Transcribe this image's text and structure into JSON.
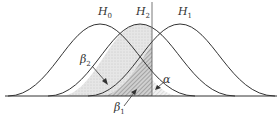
{
  "diagram": {
    "type": "overlapping normal distributions with error regions",
    "curves": [
      {
        "name": "H0",
        "label": "H",
        "sub": "0",
        "center_x": 100
      },
      {
        "name": "H2",
        "label": "H",
        "sub": "2",
        "center_x": 140
      },
      {
        "name": "H1",
        "label": "H",
        "sub": "1",
        "center_x": 180
      }
    ],
    "regions": [
      {
        "name": "beta2",
        "label": "β",
        "sub": "2"
      },
      {
        "name": "beta1",
        "label": "β",
        "sub": "1"
      },
      {
        "name": "alpha",
        "label": "α",
        "sub": ""
      }
    ],
    "critical_line_x": 152
  }
}
